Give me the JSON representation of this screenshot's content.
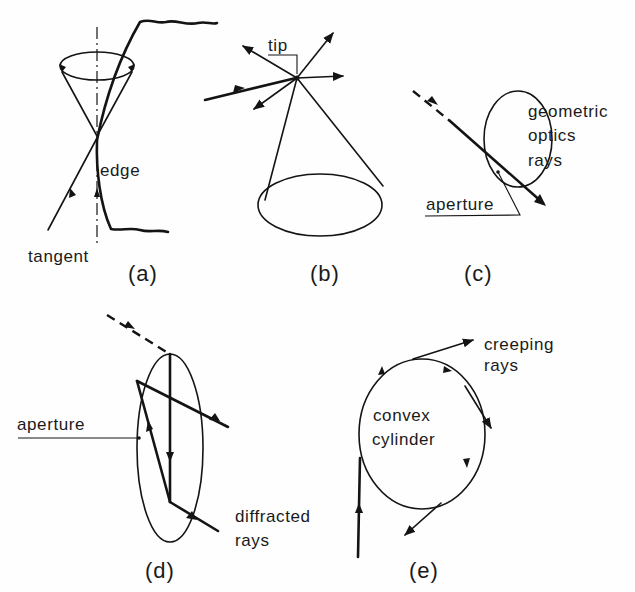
{
  "figure": {
    "panels": [
      {
        "id": "a",
        "caption": "(a)",
        "labels": {
          "edge": "edge",
          "tangent": "tangent"
        }
      },
      {
        "id": "b",
        "caption": "(b)",
        "labels": {
          "tip": "tip"
        }
      },
      {
        "id": "c",
        "caption": "(c)",
        "labels": {
          "line1": "geometric",
          "line2": "optics",
          "line3": "rays",
          "aperture": "aperture"
        }
      },
      {
        "id": "d",
        "caption": "(d)",
        "labels": {
          "aperture": "aperture",
          "line1": "diffracted",
          "line2": "rays"
        }
      },
      {
        "id": "e",
        "caption": "(e)",
        "labels": {
          "body1": "convex",
          "body2": "cylinder",
          "line1": "creeping",
          "line2": "rays"
        }
      }
    ],
    "colors": {
      "ink": "#141414",
      "paper": "#fefefe"
    }
  }
}
